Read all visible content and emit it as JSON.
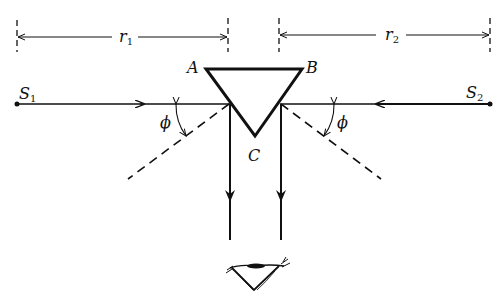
{
  "diagram": {
    "distances": [
      {
        "symbol": "r",
        "subscript": "1"
      },
      {
        "symbol": "r",
        "subscript": "2"
      }
    ],
    "sources": [
      {
        "symbol": "S",
        "subscript": "1"
      },
      {
        "symbol": "S",
        "subscript": "2"
      }
    ],
    "prism_vertices": [
      "A",
      "B",
      "C"
    ],
    "angle_label": "ϕ",
    "observer": "eye-icon",
    "colors": {
      "ink": "#111111",
      "background": "#ffffff"
    }
  }
}
